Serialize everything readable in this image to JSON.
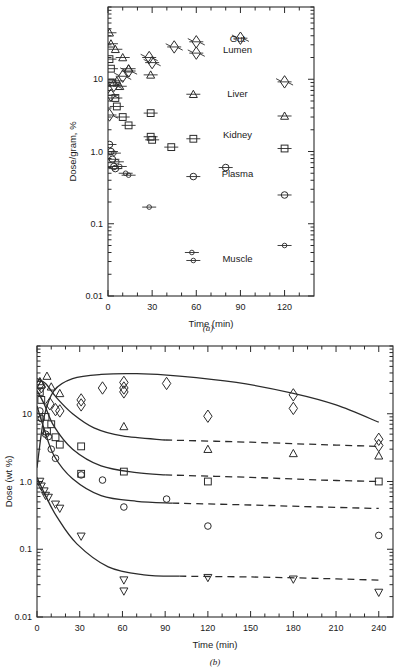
{
  "figure": {
    "panel_a_caption": "(a)",
    "panel_b_caption": "(b)"
  },
  "chart_data": [
    {
      "type": "scatter",
      "panel": "a",
      "title": "",
      "xlabel": "Time  (min)",
      "ylabel": "Dose/gram, %",
      "xlim": [
        0,
        140
      ],
      "ylim": [
        0.01,
        100
      ],
      "yscale": "log",
      "xticks": [
        0,
        30,
        60,
        90,
        120
      ],
      "xtick_labels": [
        "0",
        "30",
        "60",
        "90",
        "120"
      ],
      "x_minor_step": 10,
      "yticks": [
        10,
        1.0,
        0.1,
        0.01
      ],
      "ytick_labels": [
        "10",
        "1.0",
        "0.1",
        "0.01"
      ],
      "grid": false,
      "legend_position": "inline-right",
      "error_bars": "horizontal",
      "series": [
        {
          "name": "Gut Lumen",
          "marker": "diamond-star",
          "label": "Gut\nLumen",
          "label_x": 88,
          "label_y": 33,
          "points": [
            {
              "x": 1,
              "y": 3.2
            },
            {
              "x": 2,
              "y": 6.0
            },
            {
              "x": 4,
              "y": 8.2
            },
            {
              "x": 10,
              "y": 11.0
            },
            {
              "x": 14,
              "y": 13.0
            },
            {
              "x": 28,
              "y": 20.0
            },
            {
              "x": 30,
              "y": 17.0
            },
            {
              "x": 45,
              "y": 28.0
            },
            {
              "x": 60,
              "y": 33.0
            },
            {
              "x": 60,
              "y": 23.0
            },
            {
              "x": 90,
              "y": 37.0
            },
            {
              "x": 120,
              "y": 9.2
            }
          ]
        },
        {
          "name": "Liver",
          "marker": "triangle-up",
          "label": "Liver",
          "label_x": 88,
          "label_y": 5.6,
          "points": [
            {
              "x": 1,
              "y": 44.0
            },
            {
              "x": 2,
              "y": 31.0
            },
            {
              "x": 5,
              "y": 26.0
            },
            {
              "x": 6,
              "y": 9.5
            },
            {
              "x": 8,
              "y": 8.0
            },
            {
              "x": 10,
              "y": 20.0
            },
            {
              "x": 14,
              "y": 14.0
            },
            {
              "x": 29,
              "y": 11.5
            },
            {
              "x": 58,
              "y": 6.2
            },
            {
              "x": 120,
              "y": 3.1
            }
          ]
        },
        {
          "name": "Kidney",
          "marker": "square",
          "label": "Kidney",
          "label_x": 88,
          "label_y": 1.55,
          "points": [
            {
              "x": 1,
              "y": 19.0
            },
            {
              "x": 2,
              "y": 14.0
            },
            {
              "x": 3,
              "y": 9.0
            },
            {
              "x": 5,
              "y": 5.5
            },
            {
              "x": 6,
              "y": 4.2
            },
            {
              "x": 10,
              "y": 3.0
            },
            {
              "x": 14,
              "y": 2.3
            },
            {
              "x": 29,
              "y": 3.4
            },
            {
              "x": 29,
              "y": 1.6
            },
            {
              "x": 30,
              "y": 1.45
            },
            {
              "x": 43,
              "y": 1.15
            },
            {
              "x": 58,
              "y": 1.5
            },
            {
              "x": 120,
              "y": 1.1
            }
          ]
        },
        {
          "name": "Plasma",
          "marker": "circle",
          "label": "Plasma",
          "label_x": 88,
          "label_y": 0.44,
          "points": [
            {
              "x": 1,
              "y": 1.25
            },
            {
              "x": 2,
              "y": 1.0
            },
            {
              "x": 3,
              "y": 0.78
            },
            {
              "x": 4,
              "y": 0.62
            },
            {
              "x": 5,
              "y": 0.58
            },
            {
              "x": 58,
              "y": 0.45
            },
            {
              "x": 80,
              "y": 0.6
            },
            {
              "x": 120,
              "y": 0.25
            }
          ]
        },
        {
          "name": "Muscle",
          "marker": "circle-small",
          "label": "Muscle",
          "label_x": 88,
          "label_y": 0.03,
          "points": [
            {
              "x": 4,
              "y": 0.95
            },
            {
              "x": 6,
              "y": 0.72
            },
            {
              "x": 8,
              "y": 0.62
            },
            {
              "x": 12,
              "y": 0.5
            },
            {
              "x": 14,
              "y": 0.47
            },
            {
              "x": 28,
              "y": 0.17
            },
            {
              "x": 57,
              "y": 0.04
            },
            {
              "x": 58,
              "y": 0.031
            },
            {
              "x": 120,
              "y": 0.05
            }
          ]
        }
      ]
    },
    {
      "type": "scatter",
      "panel": "b",
      "title": "",
      "xlabel": "Time  (min)",
      "ylabel": "Dose (wt %)",
      "xlim": [
        0,
        250
      ],
      "ylim": [
        0.01,
        100
      ],
      "yscale": "log",
      "xticks": [
        0,
        30,
        60,
        90,
        120,
        150,
        180,
        210,
        240
      ],
      "xtick_labels": [
        "0",
        "30",
        "60",
        "90",
        "120",
        "150",
        "180",
        "210",
        "240"
      ],
      "yticks": [
        10,
        1.0,
        0.1,
        0.01
      ],
      "ytick_labels": [
        "10",
        "1.0",
        "0.1",
        "0.01"
      ],
      "grid": false,
      "legend_position": "none",
      "series": [
        {
          "name": "Gut Lumen",
          "marker": "diamond",
          "points": [
            {
              "x": 2,
              "y": 27.0
            },
            {
              "x": 3,
              "y": 25.0
            },
            {
              "x": 9,
              "y": 14.0
            },
            {
              "x": 13,
              "y": 11.5
            },
            {
              "x": 16,
              "y": 11.0
            },
            {
              "x": 31,
              "y": 16.0
            },
            {
              "x": 31,
              "y": 13.5
            },
            {
              "x": 46,
              "y": 24.0
            },
            {
              "x": 61,
              "y": 29.0
            },
            {
              "x": 61,
              "y": 24.0
            },
            {
              "x": 61,
              "y": 21.0
            },
            {
              "x": 91,
              "y": 28.0
            },
            {
              "x": 120,
              "y": 9.2
            },
            {
              "x": 180,
              "y": 19.0
            },
            {
              "x": 180,
              "y": 12.0
            },
            {
              "x": 240,
              "y": 4.2
            },
            {
              "x": 240,
              "y": 3.4
            }
          ],
          "fit_solid": [
            {
              "x": 0,
              "y": 1.6
            },
            {
              "x": 5,
              "y": 9.0
            },
            {
              "x": 12,
              "y": 22.0
            },
            {
              "x": 25,
              "y": 33.0
            },
            {
              "x": 45,
              "y": 38.0
            },
            {
              "x": 70,
              "y": 39.0
            },
            {
              "x": 100,
              "y": 36.0
            },
            {
              "x": 140,
              "y": 29.0
            },
            {
              "x": 180,
              "y": 20.0
            },
            {
              "x": 210,
              "y": 13.5
            },
            {
              "x": 240,
              "y": 7.5
            }
          ],
          "fit_dashed": []
        },
        {
          "name": "Liver",
          "marker": "triangle-up",
          "points": [
            {
              "x": 2,
              "y": 30.0
            },
            {
              "x": 3,
              "y": 27.0
            },
            {
              "x": 7,
              "y": 36.0
            },
            {
              "x": 10,
              "y": 25.0
            },
            {
              "x": 16,
              "y": 20.0
            },
            {
              "x": 61,
              "y": 6.5
            },
            {
              "x": 120,
              "y": 3.0
            },
            {
              "x": 180,
              "y": 2.6
            },
            {
              "x": 240,
              "y": 2.4
            }
          ],
          "fit_solid": [
            {
              "x": 0,
              "y": 33.0
            },
            {
              "x": 6,
              "y": 28.0
            },
            {
              "x": 14,
              "y": 17.0
            },
            {
              "x": 25,
              "y": 10.0
            },
            {
              "x": 40,
              "y": 6.2
            },
            {
              "x": 60,
              "y": 4.7
            },
            {
              "x": 90,
              "y": 4.1
            }
          ],
          "fit_dashed": [
            {
              "x": 90,
              "y": 4.1
            },
            {
              "x": 150,
              "y": 3.8
            },
            {
              "x": 200,
              "y": 3.5
            },
            {
              "x": 240,
              "y": 3.3
            }
          ]
        },
        {
          "name": "Kidney",
          "marker": "square",
          "points": [
            {
              "x": 2,
              "y": 21.0
            },
            {
              "x": 3,
              "y": 16.0
            },
            {
              "x": 6,
              "y": 9.0
            },
            {
              "x": 7,
              "y": 5.5
            },
            {
              "x": 10,
              "y": 7.0
            },
            {
              "x": 13,
              "y": 4.5
            },
            {
              "x": 16,
              "y": 3.5
            },
            {
              "x": 31,
              "y": 3.3
            },
            {
              "x": 31,
              "y": 1.3
            },
            {
              "x": 61,
              "y": 1.4
            },
            {
              "x": 120,
              "y": 1.0
            },
            {
              "x": 240,
              "y": 1.0
            }
          ],
          "fit_solid": [
            {
              "x": 0,
              "y": 22.0
            },
            {
              "x": 5,
              "y": 14.0
            },
            {
              "x": 12,
              "y": 6.5
            },
            {
              "x": 25,
              "y": 3.0
            },
            {
              "x": 45,
              "y": 1.7
            },
            {
              "x": 70,
              "y": 1.35
            },
            {
              "x": 90,
              "y": 1.25
            }
          ],
          "fit_dashed": [
            {
              "x": 90,
              "y": 1.25
            },
            {
              "x": 150,
              "y": 1.15
            },
            {
              "x": 200,
              "y": 1.05
            },
            {
              "x": 240,
              "y": 1.0
            }
          ]
        },
        {
          "name": "Plasma",
          "marker": "circle",
          "points": [
            {
              "x": 2,
              "y": 11.0
            },
            {
              "x": 3,
              "y": 8.5
            },
            {
              "x": 6,
              "y": 5.0
            },
            {
              "x": 8,
              "y": 4.6
            },
            {
              "x": 10,
              "y": 3.0
            },
            {
              "x": 13,
              "y": 2.2
            },
            {
              "x": 31,
              "y": 1.25
            },
            {
              "x": 46,
              "y": 1.05
            },
            {
              "x": 61,
              "y": 0.42
            },
            {
              "x": 91,
              "y": 0.55
            },
            {
              "x": 120,
              "y": 0.22
            },
            {
              "x": 240,
              "y": 0.16
            }
          ],
          "fit_solid": [
            {
              "x": 0,
              "y": 13.0
            },
            {
              "x": 5,
              "y": 6.0
            },
            {
              "x": 12,
              "y": 2.4
            },
            {
              "x": 25,
              "y": 1.1
            },
            {
              "x": 45,
              "y": 0.62
            },
            {
              "x": 70,
              "y": 0.51
            },
            {
              "x": 95,
              "y": 0.48
            }
          ],
          "fit_dashed": [
            {
              "x": 95,
              "y": 0.48
            },
            {
              "x": 150,
              "y": 0.45
            },
            {
              "x": 200,
              "y": 0.42
            },
            {
              "x": 240,
              "y": 0.4
            }
          ]
        },
        {
          "name": "Muscle",
          "marker": "triangle-down",
          "points": [
            {
              "x": 2,
              "y": 1.0
            },
            {
              "x": 3,
              "y": 0.85
            },
            {
              "x": 5,
              "y": 0.72
            },
            {
              "x": 6,
              "y": 0.62
            },
            {
              "x": 8,
              "y": 0.58
            },
            {
              "x": 13,
              "y": 0.46
            },
            {
              "x": 16,
              "y": 0.4
            },
            {
              "x": 31,
              "y": 0.155
            },
            {
              "x": 61,
              "y": 0.035
            },
            {
              "x": 61,
              "y": 0.024
            },
            {
              "x": 120,
              "y": 0.038
            },
            {
              "x": 180,
              "y": 0.036
            },
            {
              "x": 240,
              "y": 0.023
            }
          ],
          "fit_solid": [
            {
              "x": 0,
              "y": 1.15
            },
            {
              "x": 6,
              "y": 0.62
            },
            {
              "x": 14,
              "y": 0.3
            },
            {
              "x": 28,
              "y": 0.12
            },
            {
              "x": 50,
              "y": 0.055
            },
            {
              "x": 75,
              "y": 0.042
            },
            {
              "x": 100,
              "y": 0.04
            }
          ],
          "fit_dashed": [
            {
              "x": 100,
              "y": 0.04
            },
            {
              "x": 150,
              "y": 0.039
            },
            {
              "x": 200,
              "y": 0.037
            },
            {
              "x": 240,
              "y": 0.035
            }
          ]
        }
      ]
    }
  ]
}
